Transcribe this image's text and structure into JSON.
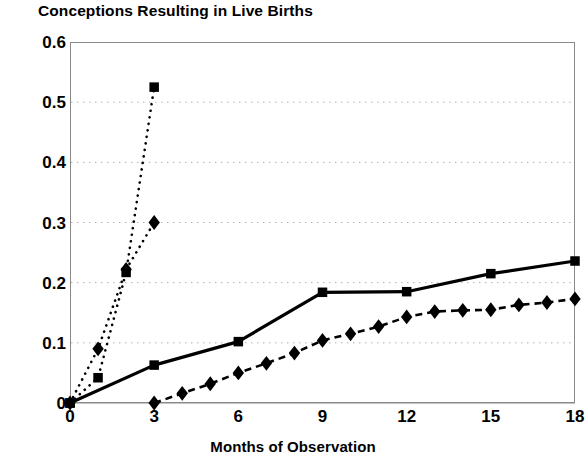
{
  "chart_data": {
    "type": "line",
    "title": "Conceptions Resulting in Live Births",
    "xlabel": "Months of Observation",
    "ylabel": "",
    "xlim": [
      0,
      18
    ],
    "ylim": [
      0,
      0.6
    ],
    "xticks": [
      "0",
      "3",
      "6",
      "9",
      "12",
      "15",
      "18"
    ],
    "xtick_values": [
      0,
      3,
      6,
      9,
      12,
      15,
      18
    ],
    "yticks": [
      "0",
      "0.1",
      "0.2",
      "0.3",
      "0.4",
      "0.5",
      "0.6"
    ],
    "ytick_values": [
      0,
      0.1,
      0.2,
      0.3,
      0.4,
      0.5,
      0.6
    ],
    "grid": "horizontal-dotted",
    "legend": "none",
    "series": [
      {
        "name": "dotted-square-series",
        "line_style": "dotted",
        "marker": "square",
        "x": [
          0,
          1,
          2,
          3
        ],
        "values": [
          0.0,
          0.042,
          0.217,
          0.525
        ]
      },
      {
        "name": "dotted-diamond-series",
        "line_style": "dotted",
        "marker": "diamond",
        "x": [
          0,
          1,
          2,
          3
        ],
        "values": [
          0.0,
          0.09,
          0.222,
          0.3
        ]
      },
      {
        "name": "solid-square-series",
        "line_style": "solid",
        "marker": "square",
        "x": [
          0,
          3,
          6,
          9,
          12,
          15,
          18
        ],
        "values": [
          0.0,
          0.063,
          0.102,
          0.184,
          0.185,
          0.215,
          0.236
        ]
      },
      {
        "name": "dashed-diamond-series",
        "line_style": "dashed",
        "marker": "diamond",
        "x": [
          3,
          4,
          5,
          6,
          7,
          8,
          9,
          10,
          11,
          12,
          13,
          14,
          15,
          16,
          17,
          18
        ],
        "values": [
          0.0,
          0.016,
          0.032,
          0.05,
          0.066,
          0.083,
          0.104,
          0.115,
          0.127,
          0.143,
          0.152,
          0.154,
          0.155,
          0.163,
          0.167,
          0.173
        ]
      }
    ]
  },
  "colors": {
    "ink": "#000000",
    "frame": "#8a8a8a",
    "grid": "#b0b0b0",
    "background": "#ffffff"
  }
}
